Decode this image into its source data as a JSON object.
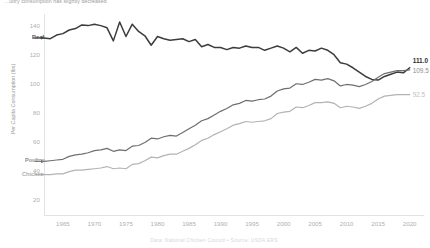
{
  "subtitle": "…ultry consumption has slightly decreased",
  "footer": "Data: National Chicken Council • Source: USDA ERS",
  "colors": {
    "beef": "#3c3c3c",
    "poultry": "#6f6f6f",
    "chicken": "#b3b3b3",
    "axis": "#e2e2e2",
    "tick_text": "#b0b0b0"
  },
  "annotations": {
    "beef_label": "Beef",
    "poultry_label": "Poultry",
    "chicken_label": "Chicken",
    "beef_end": "111.0",
    "poultry_end": "109.5",
    "chicken_end": "92.5"
  },
  "chart_data": {
    "type": "line",
    "title": "",
    "subtitle": "…ultry consumption has slightly decreased",
    "xlabel": "",
    "ylabel": "Per Capita Consumption (lbs)",
    "xlim": [
      1962,
      2021
    ],
    "ylim": [
      10,
      148
    ],
    "xticks": [
      1965,
      1970,
      1975,
      1980,
      1985,
      1990,
      1995,
      2000,
      2005,
      2010,
      2015,
      2020
    ],
    "yticks": [
      20,
      40,
      60,
      80,
      100,
      120,
      140
    ],
    "grid": false,
    "legend": "inline-labels",
    "x": [
      1962,
      1963,
      1964,
      1965,
      1966,
      1967,
      1968,
      1969,
      1970,
      1971,
      1972,
      1973,
      1974,
      1975,
      1976,
      1977,
      1978,
      1979,
      1980,
      1981,
      1982,
      1983,
      1984,
      1985,
      1986,
      1987,
      1988,
      1989,
      1990,
      1991,
      1992,
      1993,
      1994,
      1995,
      1996,
      1997,
      1998,
      1999,
      2000,
      2001,
      2002,
      2003,
      2004,
      2005,
      2006,
      2007,
      2008,
      2009,
      2010,
      2011,
      2012,
      2013,
      2014,
      2015,
      2016,
      2017,
      2018,
      2019,
      2020
    ],
    "series": [
      {
        "name": "Beef",
        "color": "#3c3c3c",
        "end_value": 111.0,
        "values": [
          131.5,
          131.0,
          133.5,
          134.5,
          137.0,
          138.0,
          140.5,
          140.0,
          141.0,
          140.0,
          138.5,
          129.5,
          142.5,
          132.5,
          141.0,
          136.0,
          133.0,
          126.5,
          132.5,
          131.0,
          130.0,
          130.5,
          131.0,
          129.0,
          130.5,
          125.5,
          127.0,
          125.0,
          125.0,
          123.5,
          125.0,
          124.5,
          126.0,
          125.0,
          125.0,
          123.0,
          124.5,
          126.0,
          124.5,
          122.0,
          125.0,
          121.0,
          123.0,
          122.5,
          124.5,
          123.0,
          120.0,
          114.5,
          113.5,
          111.0,
          108.0,
          105.0,
          103.0,
          102.5,
          105.0,
          106.5,
          108.0,
          107.5,
          111.0
        ]
      },
      {
        "name": "Poultry",
        "color": "#6f6f6f",
        "end_value": 109.5,
        "values": [
          46.5,
          47.0,
          47.5,
          48.0,
          50.0,
          51.0,
          51.5,
          52.5,
          54.0,
          54.5,
          55.5,
          53.5,
          54.5,
          54.0,
          57.0,
          57.5,
          59.5,
          62.5,
          62.0,
          63.5,
          64.5,
          64.0,
          66.5,
          69.0,
          71.5,
          74.5,
          76.0,
          78.5,
          81.0,
          83.0,
          85.5,
          86.5,
          88.5,
          88.0,
          89.0,
          89.5,
          91.5,
          95.0,
          96.5,
          97.0,
          100.0,
          99.5,
          101.0,
          103.0,
          102.5,
          103.5,
          102.0,
          98.5,
          99.5,
          99.0,
          98.0,
          99.5,
          101.5,
          104.5,
          107.0,
          108.0,
          109.0,
          109.0,
          109.5
        ]
      },
      {
        "name": "Chicken",
        "color": "#b3b3b3",
        "end_value": 92.5,
        "values": [
          37.5,
          37.5,
          38.0,
          38.0,
          39.5,
          40.5,
          40.5,
          41.0,
          41.5,
          42.0,
          43.0,
          41.5,
          42.0,
          41.5,
          44.5,
          45.0,
          47.0,
          49.5,
          49.0,
          50.5,
          51.5,
          51.5,
          53.5,
          55.5,
          58.0,
          61.0,
          62.5,
          65.0,
          67.0,
          69.0,
          71.5,
          72.5,
          74.0,
          73.5,
          74.0,
          74.5,
          76.0,
          79.5,
          80.5,
          81.0,
          84.0,
          83.5,
          85.0,
          87.0,
          87.0,
          87.5,
          86.5,
          83.5,
          84.5,
          84.0,
          83.0,
          84.5,
          86.5,
          89.5,
          91.5,
          92.0,
          92.5,
          92.5,
          92.5
        ]
      }
    ]
  }
}
